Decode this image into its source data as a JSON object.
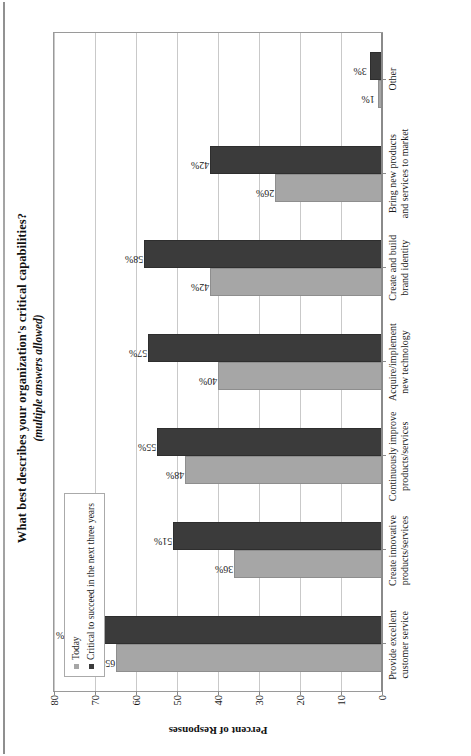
{
  "chart_data": {
    "type": "bar",
    "orientation": "vertical-grouped",
    "title": "What best describes your organization's critical capabilities?",
    "subtitle": "(multiple answers allowed)",
    "xlabel": "",
    "ylabel": "Percent of Responses",
    "ylim": [
      0,
      80
    ],
    "ytick_labels": [
      "80",
      "70",
      "60",
      "50",
      "40",
      "30",
      "20",
      "10",
      "0"
    ],
    "ytick_values": [
      80,
      70,
      60,
      50,
      40,
      30,
      20,
      10,
      0
    ],
    "grid": true,
    "legend_position": "top-left-inside",
    "value_label_suffix": "%",
    "categories": [
      "Provide excellent customer service",
      "Create innovative products/services",
      "Continuously improve products/services",
      "Acquire/implement new technology",
      "Create and build brand identity",
      "Bring new products and services to market",
      "Other"
    ],
    "series": [
      {
        "name": "Today",
        "color": "#a6a6a6",
        "values": [
          65,
          36,
          48,
          40,
          42,
          26,
          1
        ],
        "labels": [
          "65%",
          "36%",
          "48%",
          "40%",
          "42%",
          "26%",
          "1%"
        ]
      },
      {
        "name": "Critical to succeed in the next three years",
        "color": "#3b3b3b",
        "values": [
          75,
          51,
          55,
          57,
          58,
          42,
          3
        ],
        "labels": [
          "75%",
          "51%",
          "55%",
          "57%",
          "58%",
          "42%",
          "3%"
        ]
      }
    ]
  },
  "colors": {
    "today_bar": "#a6a6a6",
    "critical_bar": "#3b3b3b",
    "gridline": "#c9c9c9",
    "frame": "#9a9a9a",
    "text": "#1a1a1a",
    "page_background": "#ffffff"
  }
}
